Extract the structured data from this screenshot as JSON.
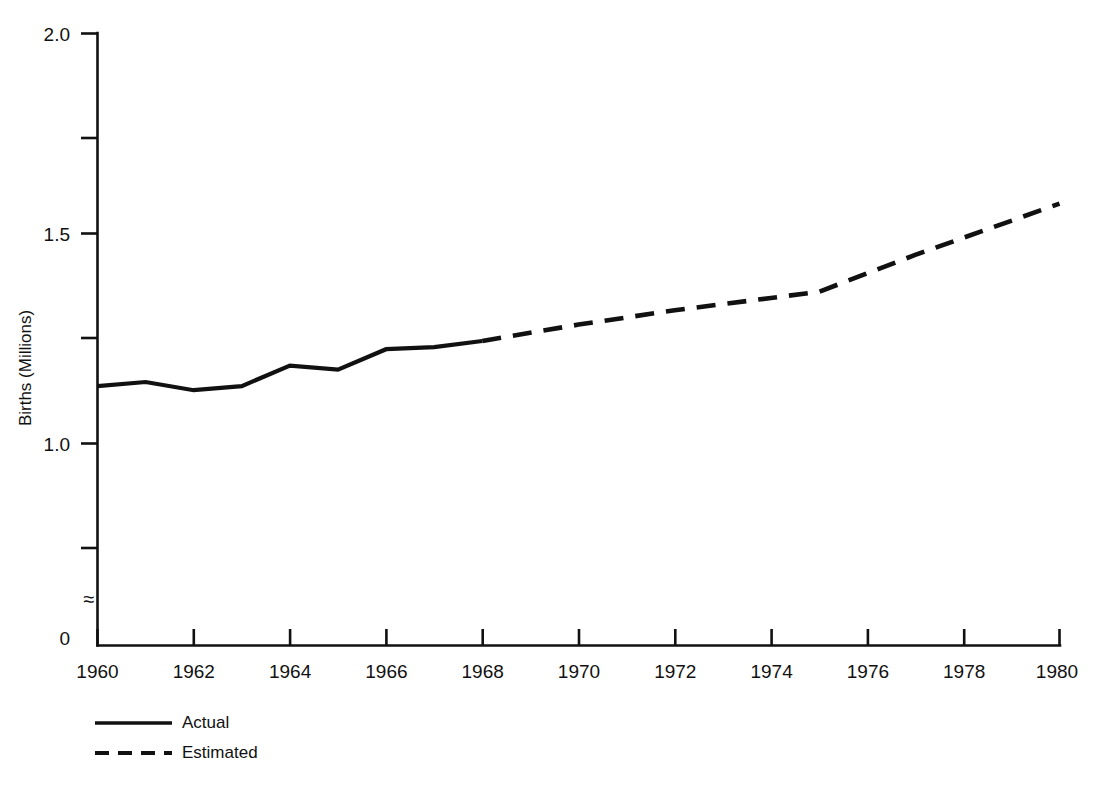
{
  "chart_data": {
    "type": "line",
    "title": "",
    "xlabel": "",
    "ylabel": "Births (Millions)",
    "xlim": [
      1960,
      1980
    ],
    "ylim": [
      0,
      2.0
    ],
    "grid": false,
    "axis_break": {
      "symbol": "≈",
      "between": [
        0,
        0.65
      ],
      "note": "y-axis broken between 0 and the lowest plotted range"
    },
    "y_ticks_major": [
      "2.0",
      "1.5",
      "1.0",
      "0"
    ],
    "y_tick_values_major": [
      2.0,
      1.5,
      1.0,
      0
    ],
    "y_ticks_minor_values": [
      1.75,
      1.25,
      0.75
    ],
    "x_ticks": [
      "1960",
      "1962",
      "1964",
      "1966",
      "1968",
      "1970",
      "1972",
      "1974",
      "1976",
      "1978",
      "1980"
    ],
    "x_tick_values": [
      1960,
      1962,
      1964,
      1966,
      1968,
      1970,
      1972,
      1974,
      1976,
      1978,
      1980
    ],
    "legend_position": "below-left",
    "series": [
      {
        "name": "Actual",
        "style": "solid",
        "color": "#111111",
        "x": [
          1960,
          1961,
          1962,
          1963,
          1964,
          1965,
          1966,
          1967,
          1968
        ],
        "values": [
          1.14,
          1.15,
          1.13,
          1.14,
          1.19,
          1.18,
          1.23,
          1.235,
          1.25
        ]
      },
      {
        "name": "Estimated",
        "style": "dashed",
        "color": "#111111",
        "x": [
          1968,
          1970,
          1972,
          1974,
          1975,
          1977,
          1980
        ],
        "values": [
          1.25,
          1.29,
          1.325,
          1.355,
          1.37,
          1.46,
          1.585
        ]
      }
    ]
  },
  "legend": {
    "items": [
      {
        "label": "Actual",
        "style": "solid"
      },
      {
        "label": "Estimated",
        "style": "dashed"
      }
    ]
  },
  "axes": {
    "y_title": "Births (Millions)",
    "break_symbol": "≈"
  }
}
